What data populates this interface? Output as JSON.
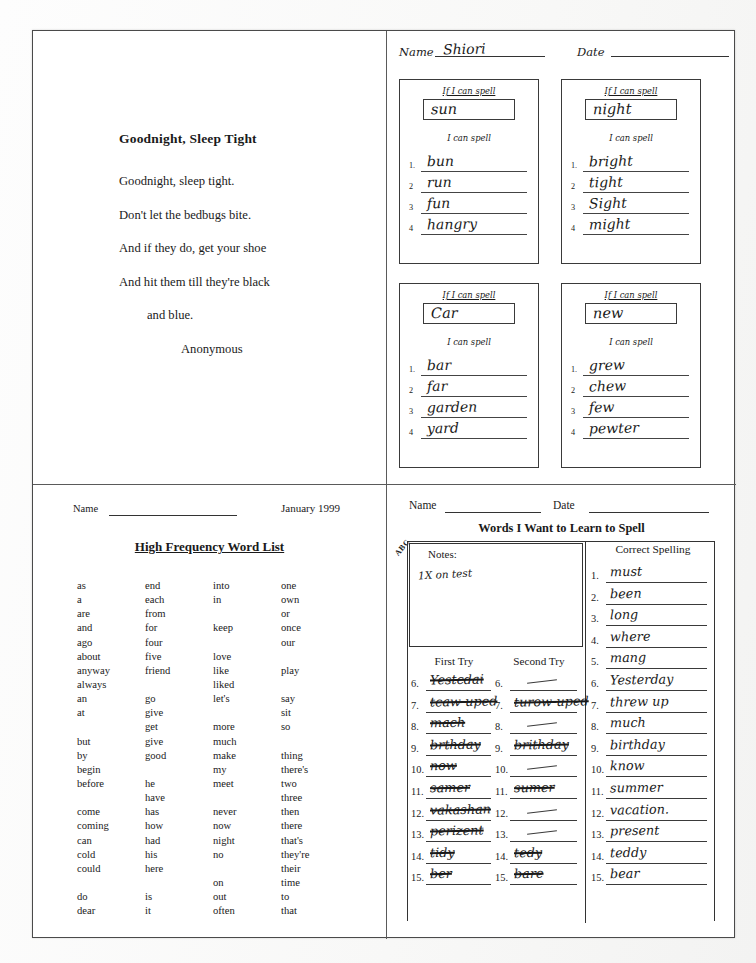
{
  "poem": {
    "title": "Goodnight, Sleep Tight",
    "lines": [
      "Goodnight, sleep tight.",
      "Don't let the bedbugs bite.",
      "And if they do, get your shoe",
      "And hit them till they're black",
      "and blue."
    ],
    "attribution": "Anonymous"
  },
  "spelling_worksheet": {
    "name_label": "Name",
    "name_value": "Shiori",
    "date_label": "Date",
    "date_value": "",
    "if_label": "If I can spell",
    "can_label": "I can spell",
    "boxes": [
      {
        "target": "sun",
        "words": [
          "bun",
          "run",
          "fun",
          "hangry"
        ]
      },
      {
        "target": "night",
        "words": [
          "bright",
          "tight",
          "Sight",
          "might"
        ]
      },
      {
        "target": "Car",
        "words": [
          "bar",
          "far",
          "garden",
          "yard"
        ]
      },
      {
        "target": "new",
        "words": [
          "grew",
          "chew",
          "few",
          "pewter"
        ]
      }
    ],
    "numbers": [
      "1.",
      "2",
      "3",
      "4"
    ]
  },
  "word_list": {
    "name_label": "Name",
    "date": "January 1999",
    "title": "High Frequency Word List",
    "columns": [
      [
        "as",
        "a",
        "are",
        "and",
        "ago",
        "about",
        "anyway",
        "always",
        "an",
        "at",
        "",
        "but",
        "by",
        "begin",
        "before",
        "",
        "come",
        "coming",
        "can",
        "cold",
        "could",
        "",
        "do",
        "dear"
      ],
      [
        "end",
        "each",
        "from",
        "for",
        "four",
        "five",
        "friend",
        "",
        "go",
        "give",
        "get",
        "give",
        "good",
        "",
        "he",
        "have",
        "has",
        "how",
        "had",
        "his",
        "here",
        "",
        "is",
        "it"
      ],
      [
        "into",
        "in",
        "",
        "keep",
        "",
        "love",
        "like",
        "liked",
        "let's",
        "",
        "more",
        "much",
        "make",
        "my",
        "meet",
        "",
        "never",
        "now",
        "night",
        "no",
        "",
        "on",
        "out",
        "often"
      ],
      [
        "one",
        "own",
        "or",
        "once",
        "our",
        "",
        "play",
        "",
        "say",
        "sit",
        "so",
        "",
        "thing",
        "there's",
        "two",
        "three",
        "then",
        "there",
        "that's",
        "they're",
        "their",
        "time",
        "to",
        "that"
      ]
    ]
  },
  "learn_to_spell": {
    "name_label": "Name",
    "date_label": "Date",
    "title": "Words I Want to Learn to Spell",
    "abc_tab": "ABC",
    "notes_label": "Notes:",
    "notes_value": "1X on test",
    "correct_spelling_label": "Correct Spelling",
    "first_try_label": "First Try",
    "second_try_label": "Second Try",
    "rows": [
      {
        "num": "1.",
        "first": "",
        "second": "",
        "correct": "must"
      },
      {
        "num": "2.",
        "first": "",
        "second": "",
        "correct": "been"
      },
      {
        "num": "3.",
        "first": "",
        "second": "",
        "correct": "long"
      },
      {
        "num": "4.",
        "first": "",
        "second": "",
        "correct": "where"
      },
      {
        "num": "5.",
        "first": "",
        "second": "",
        "correct": "mang"
      },
      {
        "num": "6.",
        "first": "Yestcdai",
        "second": "",
        "correct": "Yesterday"
      },
      {
        "num": "7.",
        "first": "tcaw-uped",
        "second": "turow-uped",
        "correct": "threw up"
      },
      {
        "num": "8.",
        "first": "mach",
        "second": "",
        "correct": "much"
      },
      {
        "num": "9.",
        "first": "brthday",
        "second": "brithday",
        "correct": "birthday"
      },
      {
        "num": "10.",
        "first": "now",
        "second": "",
        "correct": "know"
      },
      {
        "num": "11.",
        "first": "samer",
        "second": "sumer",
        "correct": "summer"
      },
      {
        "num": "12.",
        "first": "vakashan",
        "second": "",
        "correct": "vacation."
      },
      {
        "num": "13.",
        "first": "perizent",
        "second": "",
        "correct": "present"
      },
      {
        "num": "14.",
        "first": "tidy",
        "second": "tedy",
        "correct": "teddy"
      },
      {
        "num": "15.",
        "first": "ber",
        "second": "bare",
        "correct": "bear"
      }
    ]
  }
}
